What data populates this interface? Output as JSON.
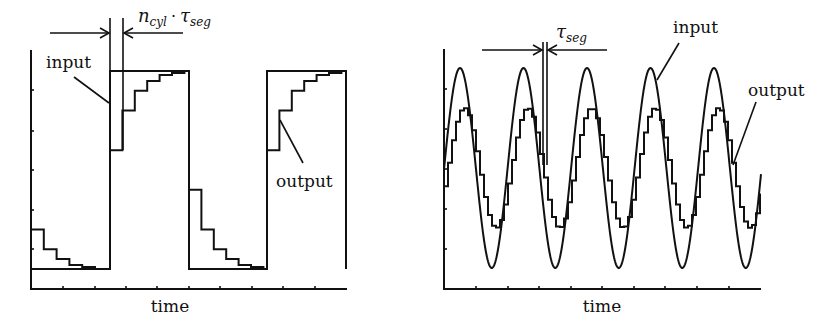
{
  "panels": [
    {
      "id": "square-wave",
      "xlabel": "time",
      "labels": {
        "input": "input",
        "output": "output"
      },
      "annotation": {
        "main": "n",
        "sub1": "cyl",
        "dot": "·",
        "tau": "τ",
        "sub2": "seg"
      }
    },
    {
      "id": "sine-wave",
      "xlabel": "time",
      "labels": {
        "input": "input",
        "output": "output"
      },
      "annotation": {
        "tau": "τ",
        "sub": "seg"
      }
    }
  ],
  "chart_data": [
    {
      "type": "line",
      "title": "Step response of square-wave input (staircase output)",
      "xlabel": "time",
      "ylabel": "",
      "grid": false,
      "series": [
        {
          "name": "input",
          "shape": "square wave",
          "values_normalized": [
            0,
            1,
            0,
            1
          ],
          "transitions_px": [
            110,
            189,
            267
          ]
        },
        {
          "name": "output",
          "shape": "staircase exponential approach",
          "rise_steps_normalized": [
            0.6,
            0.8,
            0.9,
            0.95,
            0.98,
            0.99,
            1.0
          ],
          "fall_steps_normalized": [
            0.4,
            0.2,
            0.1,
            0.05,
            0.02,
            0.01,
            0.0
          ]
        }
      ],
      "annotation": "n_cyl · τ_seg (delay between input step and first output step)"
    },
    {
      "type": "line",
      "title": "Sinusoidal input with staircase output",
      "xlabel": "time",
      "ylabel": "",
      "grid": false,
      "series": [
        {
          "name": "input",
          "shape": "sine",
          "amplitude_normalized": 1.0,
          "periods": 5
        },
        {
          "name": "output",
          "shape": "staircase sine (attenuated, lagged)",
          "amplitude_normalized": 0.6,
          "periods": 5
        }
      ],
      "annotation": "τ_seg (step width)"
    }
  ]
}
